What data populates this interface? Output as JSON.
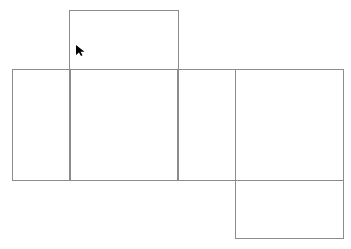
{
  "diagram": {
    "type": "cube-net",
    "line_color": "#8c8c8c",
    "background": "#ffffff",
    "faces": [
      {
        "id": "top",
        "x": 69,
        "y": 10,
        "w": 110,
        "h": 60
      },
      {
        "id": "left",
        "x": 12,
        "y": 69,
        "w": 59,
        "h": 112
      },
      {
        "id": "front",
        "x": 69,
        "y": 69,
        "w": 110,
        "h": 112
      },
      {
        "id": "right-narrow",
        "x": 177,
        "y": 69,
        "w": 59,
        "h": 112
      },
      {
        "id": "back",
        "x": 235,
        "y": 69,
        "w": 109,
        "h": 112
      },
      {
        "id": "bottom",
        "x": 235,
        "y": 180,
        "w": 109,
        "h": 59
      }
    ],
    "cursor": {
      "icon": "mouse-pointer-icon",
      "x": 76,
      "y": 43,
      "color": "#000000"
    }
  }
}
